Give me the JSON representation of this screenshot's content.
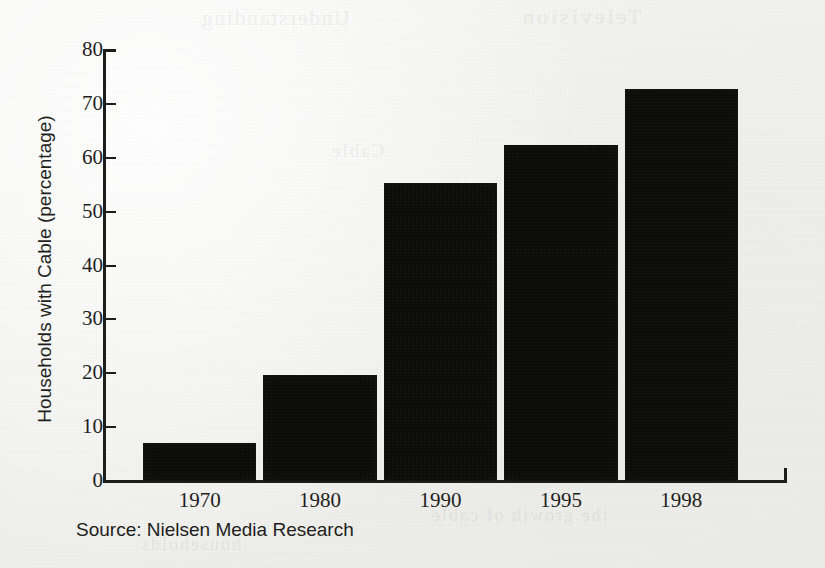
{
  "chart_data": {
    "type": "bar",
    "title": "",
    "xlabel": "",
    "ylabel": "Households with Cable (percentage)",
    "categories": [
      "1970",
      "1980",
      "1990",
      "1995",
      "1998"
    ],
    "values": [
      7,
      19.6,
      55.4,
      62.3,
      72.7
    ],
    "ylim": [
      0,
      80
    ],
    "yticks": [
      0,
      10,
      20,
      30,
      40,
      50,
      60,
      70,
      80
    ],
    "ytick_labels": [
      "0",
      "10",
      "20",
      "30",
      "40",
      "50",
      "60",
      "70",
      "80"
    ],
    "grid": false,
    "legend": null,
    "bar_color": "#0b0b0a",
    "axis_color": "#1d1d1b",
    "background_color": "#f1f1ee",
    "source_note": "Source: Nielsen Media Research"
  },
  "axis": {
    "y_title": "Households with Cable (percentage)"
  },
  "footer": {
    "source": "Source: Nielsen Media Research"
  },
  "bleed_through": {
    "line1": "Understanding",
    "line2": "Television",
    "line3": "Cable",
    "line4": "the growth of cable",
    "line5": "households"
  }
}
